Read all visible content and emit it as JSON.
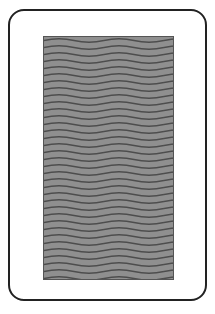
{
  "card": {
    "face": "back",
    "pattern": "wavy-lines",
    "colors": {
      "border": "#222222",
      "background": "#ffffff",
      "pattern_base": "#8a8a8a",
      "pattern_line": "#4a4a4a"
    }
  }
}
